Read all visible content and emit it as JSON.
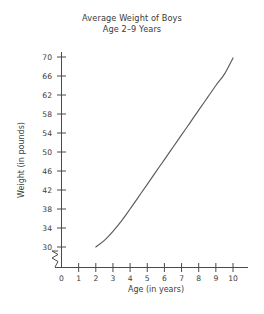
{
  "chart_data": {
    "type": "line",
    "title": "Average Weight of Boys",
    "subtitle": "Age 2–9 Years",
    "xlabel": "Age (in years)",
    "ylabel": "Weight (in pounds)",
    "xlim": [
      0,
      10
    ],
    "ylim": [
      30,
      70
    ],
    "grid": false,
    "legend": null,
    "axis_break": {
      "axis": "y",
      "below": 30,
      "style": "zigzag"
    },
    "x_ticks": [
      0,
      1,
      2,
      3,
      4,
      5,
      6,
      7,
      8,
      9,
      10
    ],
    "x_tick_labels": [
      "0",
      "1",
      "2",
      "3",
      "4",
      "5",
      "6",
      "7",
      "8",
      "9",
      "10"
    ],
    "y_ticks": [
      30,
      34,
      38,
      42,
      46,
      50,
      54,
      58,
      62,
      66,
      70
    ],
    "y_tick_labels": [
      "30",
      "34",
      "38",
      "42",
      "46",
      "50",
      "54",
      "58",
      "62",
      "66",
      "70"
    ],
    "series": [
      {
        "name": "Average weight",
        "color": "#5b5b5b",
        "x": [
          2.0,
          2.5,
          3.0,
          3.5,
          4.0,
          4.5,
          5.0,
          5.5,
          6.0,
          6.5,
          7.0,
          7.5,
          8.0,
          8.5,
          9.0,
          9.5,
          10.0
        ],
        "y": [
          30.0,
          31.4,
          33.3,
          35.5,
          38.0,
          40.6,
          43.2,
          45.8,
          48.4,
          51.0,
          53.6,
          56.2,
          58.8,
          61.4,
          64.0,
          66.4,
          69.8
        ]
      }
    ]
  },
  "labels": {
    "title": "Average Weight of Boys",
    "subtitle": "Age 2–9 Years",
    "xlabel": "Age (in years)",
    "ylabel": "Weight (in pounds)"
  }
}
